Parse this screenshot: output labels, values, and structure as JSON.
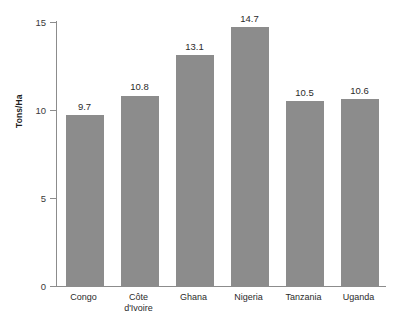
{
  "chart_data": {
    "type": "bar",
    "title": "",
    "subtitle": "",
    "xlabel": "",
    "ylabel": "Tons/Ha",
    "categories": [
      "Congo",
      "Côte d'Ivoire",
      "Ghana",
      "Nigeria",
      "Tanzania",
      "Uganda"
    ],
    "category_lines": [
      [
        "Congo"
      ],
      [
        "Côte",
        "d'Ivoire"
      ],
      [
        "Ghana"
      ],
      [
        "Nigeria"
      ],
      [
        "Tanzania"
      ],
      [
        "Uganda"
      ]
    ],
    "values": [
      9.7,
      10.8,
      13.1,
      14.7,
      10.5,
      10.6
    ],
    "value_labels": [
      "9.7",
      "10.8",
      "13.1",
      "14.7",
      "10.5",
      "10.6"
    ],
    "ylim": [
      0,
      15
    ],
    "yticks": [
      0,
      5,
      10,
      15
    ],
    "ytick_labels": [
      "0",
      "5",
      "10",
      "15"
    ],
    "grid": false,
    "legend": false,
    "legend_position": "none",
    "bar_color": "#8c8c8c",
    "axis_color": "#8c8c8c",
    "text_color": "#2b2b2b",
    "background": "#ffffff"
  }
}
